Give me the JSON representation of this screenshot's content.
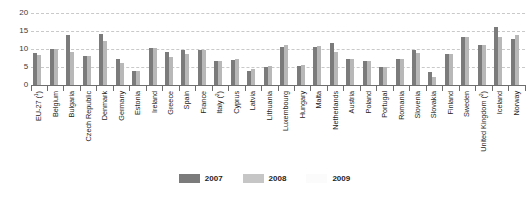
{
  "chart_data": {
    "type": "bar",
    "title": "",
    "xlabel": "",
    "ylabel": "",
    "ylim": [
      0,
      20
    ],
    "yticks": [
      0,
      5,
      10,
      15,
      20
    ],
    "grid": true,
    "legend_position": "bottom-center",
    "categories": [
      "EU-27 (¹)",
      "Belgium",
      "Bulgaria",
      "Czech Republic",
      "Denmark",
      "Germany",
      "Estonia",
      "Ireland",
      "Greece",
      "Spain",
      "France",
      "Italy (²)",
      "Cyprus",
      "Latvia",
      "Lithuania",
      "Luxembourg",
      "Hungary",
      "Malta",
      "Netherlands",
      "Austria",
      "Poland",
      "Portugal",
      "Romania",
      "Slovenia",
      "Slovakia",
      "Finland",
      "Sweden",
      "United Kingdom (²)",
      "Iceland",
      "Norway"
    ],
    "series": [
      {
        "name": "2007",
        "color": "#7b7b7b",
        "values": [
          8.9,
          10.0,
          13.9,
          8.1,
          14.2,
          7.1,
          3.8,
          10.2,
          9.2,
          9.7,
          9.8,
          6.7,
          7.0,
          4.0,
          5.0,
          10.5,
          5.4,
          10.6,
          11.7,
          7.2,
          6.6,
          4.9,
          7.3,
          9.6,
          3.5,
          8.6,
          13.3,
          11.2,
          16.1,
          12.7
        ]
      },
      {
        "name": "2008",
        "color": "#b8b8b8",
        "values": [
          8.3,
          10.0,
          9.2,
          8.1,
          12.1,
          6.2,
          3.8,
          10.2,
          7.8,
          8.5,
          9.7,
          6.7,
          7.3,
          4.5,
          5.4,
          11.0,
          5.6,
          10.9,
          9.3,
          7.3,
          6.6,
          4.9,
          7.3,
          8.9,
          2.2,
          8.6,
          13.3,
          11.2,
          13.4,
          14.0
        ]
      },
      {
        "name": "2009",
        "color": "#fdfdfd",
        "values": [
          0,
          0,
          0,
          0,
          0,
          0,
          0,
          0,
          0,
          0,
          0,
          0,
          0,
          0,
          0,
          0,
          0,
          0,
          0,
          0,
          0,
          0,
          0,
          0,
          0,
          0,
          0,
          0,
          0,
          0
        ]
      }
    ]
  },
  "legend": {
    "items": [
      {
        "label": "2007",
        "key": "y2007"
      },
      {
        "label": "2008",
        "key": "y2008"
      },
      {
        "label": "2009",
        "key": "y2009"
      }
    ]
  }
}
